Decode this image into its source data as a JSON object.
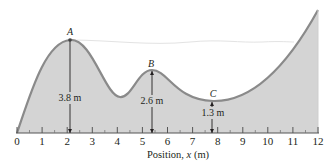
{
  "diagram": {
    "type": "roller-coaster-track-profile",
    "colors": {
      "fill": "#d4d4d4",
      "curve": "#8a8a8a",
      "axis": "#555555",
      "faint_line": "#e3e3e3",
      "text": "#231f20"
    },
    "axis": {
      "title_prefix": "Position, ",
      "title_var": "x",
      "title_unit": " (m)",
      "min": 0,
      "max": 12,
      "ticks": [
        "0",
        "1",
        "2",
        "3",
        "4",
        "5",
        "6",
        "7",
        "8",
        "9",
        "10",
        "11",
        "12"
      ]
    },
    "points": [
      {
        "label": "A",
        "x": 2.1,
        "height": "3.8 m"
      },
      {
        "label": "B",
        "x": 5.4,
        "height": "2.6 m"
      },
      {
        "label": "C",
        "x": 7.8,
        "height": "1.3 m"
      }
    ]
  }
}
